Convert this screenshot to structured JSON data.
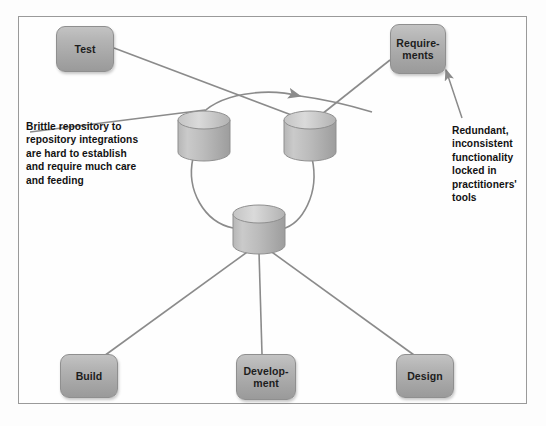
{
  "diagram": {
    "frame": {
      "border_color": "#9a9a9a",
      "background": "#fefefe"
    },
    "palette": {
      "node_fill_light": "#c3c3c3",
      "node_fill_dark": "#9a9a9a",
      "node_border": "#8f8f8f",
      "cylinder_fill_light": "#c8c8c8",
      "cylinder_fill_dark": "#a0a0a0",
      "cylinder_top": "#d2d2d2",
      "connector_line": "#8b8b8b",
      "text_color": "#121212"
    },
    "nodes": [
      {
        "id": "test",
        "label": "Test",
        "shape": "rounded-box"
      },
      {
        "id": "requirements",
        "label": "Require-\nments",
        "shape": "rounded-box"
      },
      {
        "id": "build",
        "label": "Build",
        "shape": "rounded-box"
      },
      {
        "id": "development",
        "label": "Develop-\nment",
        "shape": "rounded-box"
      },
      {
        "id": "design",
        "label": "Design",
        "shape": "rounded-box"
      }
    ],
    "repositories": [
      {
        "id": "repo-left",
        "label": "",
        "shape": "cylinder"
      },
      {
        "id": "repo-right",
        "label": "",
        "shape": "cylinder"
      },
      {
        "id": "repo-bottom",
        "label": "",
        "shape": "cylinder"
      }
    ],
    "annotations": [
      {
        "id": "annotation-left",
        "text": "Brittle repository to\nrepository integrations\nare hard to establish\nand require much care\nand feeding",
        "points_to": "repo-left"
      },
      {
        "id": "annotation-right",
        "text": "Redundant,\ninconsistent\nfunctionality\nlocked in\npractitioners'\ntools",
        "points_to": "requirements"
      }
    ],
    "connections": [
      {
        "from": "test",
        "to": "repo-right",
        "style": "line"
      },
      {
        "from": "requirements",
        "to": "repo-right",
        "style": "line"
      },
      {
        "from": "repo-left",
        "to": "repo-right",
        "style": "curve"
      },
      {
        "from": "repo-left",
        "to": "repo-bottom",
        "style": "curve"
      },
      {
        "from": "repo-right",
        "to": "repo-bottom",
        "style": "curve"
      },
      {
        "from": "repo-bottom",
        "to": "build",
        "style": "line"
      },
      {
        "from": "repo-bottom",
        "to": "development",
        "style": "line"
      },
      {
        "from": "repo-bottom",
        "to": "design",
        "style": "line"
      }
    ]
  }
}
